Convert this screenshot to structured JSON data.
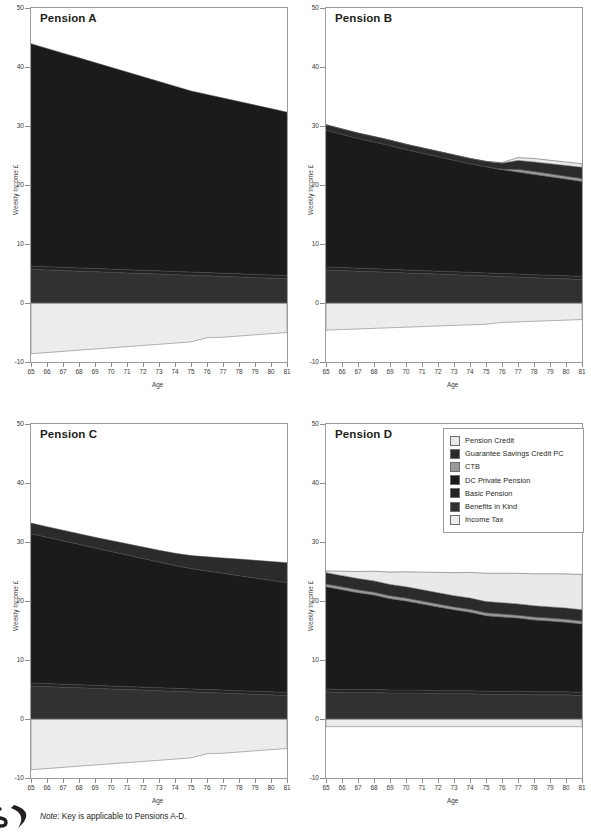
{
  "figure": {
    "note_prefix": "Note:",
    "note_text": " Key is applicable to Pensions A-D.",
    "logo_letter": "S"
  },
  "legend": {
    "title": "Key",
    "applies_to": "Pensions A-D",
    "items": [
      {
        "label": "Pension Credit",
        "color": "#e9e9e9"
      },
      {
        "label": "Guarantee Savings Credit PC",
        "color": "#2b2b2b"
      },
      {
        "label": "CTB",
        "color": "#9a9a9a"
      },
      {
        "label": "DC Private Pension",
        "color": "#1b1b1b"
      },
      {
        "label": "Basic Pension",
        "color": "#222222"
      },
      {
        "label": "Benefits in Kind",
        "color": "#313131"
      },
      {
        "label": "Income Tax",
        "color": "#ececec"
      }
    ]
  },
  "axes": {
    "ylabel": "Weekly Income £",
    "xlabel": "Age",
    "yticks": [
      "-10",
      "0",
      "10",
      "20",
      "30",
      "40",
      "50"
    ],
    "ylim": [
      -10,
      50
    ],
    "xticks": [
      "65",
      "66",
      "67",
      "68",
      "69",
      "70",
      "71",
      "72",
      "73",
      "74",
      "75",
      "76",
      "77",
      "78",
      "79",
      "80",
      "81"
    ],
    "xlim": [
      65,
      81
    ]
  },
  "chart_data": [
    {
      "type": "area",
      "title": "Pension A",
      "panel": "A",
      "xlabel": "Age",
      "ylabel": "Weekly Income £",
      "ylim": [
        -10,
        50
      ],
      "xlim": [
        65,
        81
      ],
      "grid": false,
      "x": [
        65,
        66,
        67,
        68,
        69,
        70,
        71,
        72,
        73,
        74,
        75,
        76,
        77,
        78,
        79,
        80,
        81
      ],
      "series": [
        {
          "name": "Benefits in Kind",
          "color": "#313131",
          "values": [
            5.7,
            5.6,
            5.5,
            5.4,
            5.3,
            5.2,
            5.1,
            5.0,
            4.9,
            4.8,
            4.7,
            4.6,
            4.5,
            4.4,
            4.3,
            4.2,
            4.1
          ]
        },
        {
          "name": "Basic Pension",
          "color": "#222222",
          "values": [
            0.55,
            0.55,
            0.55,
            0.55,
            0.55,
            0.55,
            0.55,
            0.55,
            0.55,
            0.55,
            0.55,
            0.55,
            0.55,
            0.55,
            0.55,
            0.55,
            0.55
          ]
        },
        {
          "name": "DC Private Pension",
          "color": "#1b1b1b",
          "values": [
            37.7,
            37.0,
            36.3,
            35.6,
            34.9,
            34.2,
            33.5,
            32.8,
            32.1,
            31.4,
            30.7,
            30.2,
            29.7,
            29.2,
            28.7,
            28.2,
            27.7
          ]
        },
        {
          "name": "CTB",
          "color": "#9a9a9a",
          "values": [
            0,
            0,
            0,
            0,
            0,
            0,
            0,
            0,
            0,
            0,
            0,
            0,
            0,
            0,
            0,
            0,
            0
          ]
        },
        {
          "name": "Guarantee Savings Credit PC",
          "color": "#2b2b2b",
          "values": [
            0,
            0,
            0,
            0,
            0,
            0,
            0,
            0,
            0,
            0,
            0,
            0,
            0,
            0,
            0,
            0,
            0
          ]
        },
        {
          "name": "Pension Credit",
          "color": "#e9e9e9",
          "values": [
            0,
            0,
            0,
            0,
            0,
            0,
            0,
            0,
            0,
            0,
            0,
            0,
            0,
            0,
            0,
            0,
            0
          ]
        },
        {
          "name": "Income Tax",
          "color": "#ececec",
          "values": [
            -8.6,
            -8.4,
            -8.2,
            -8.0,
            -7.8,
            -7.6,
            -7.4,
            -7.2,
            -7.0,
            -6.8,
            -6.6,
            -5.9,
            -5.8,
            -5.6,
            -5.4,
            -5.2,
            -5.0
          ]
        }
      ],
      "top_total_start": 44.0,
      "top_total_end": 32.4
    },
    {
      "type": "area",
      "title": "Pension B",
      "panel": "B",
      "xlabel": "Age",
      "ylabel": "Weekly Income £",
      "ylim": [
        -10,
        50
      ],
      "xlim": [
        65,
        81
      ],
      "grid": false,
      "x": [
        65,
        66,
        67,
        68,
        69,
        70,
        71,
        72,
        73,
        74,
        75,
        76,
        77,
        78,
        79,
        80,
        81
      ],
      "series": [
        {
          "name": "Benefits in Kind",
          "color": "#313131",
          "values": [
            5.6,
            5.5,
            5.4,
            5.3,
            5.2,
            5.1,
            5.0,
            4.9,
            4.8,
            4.7,
            4.6,
            4.5,
            4.4,
            4.3,
            4.2,
            4.1,
            4.0
          ]
        },
        {
          "name": "Basic Pension",
          "color": "#222222",
          "values": [
            0.5,
            0.5,
            0.5,
            0.5,
            0.5,
            0.5,
            0.5,
            0.5,
            0.5,
            0.5,
            0.5,
            0.5,
            0.5,
            0.5,
            0.5,
            0.5,
            0.5
          ]
        },
        {
          "name": "DC Private Pension",
          "color": "#1b1b1b",
          "values": [
            23.2,
            22.6,
            22.0,
            21.5,
            21.0,
            20.4,
            19.9,
            19.4,
            18.9,
            18.4,
            18.0,
            17.6,
            17.3,
            17.0,
            16.7,
            16.4,
            16.1
          ]
        },
        {
          "name": "CTB",
          "color": "#9a9a9a",
          "values": [
            0,
            0,
            0,
            0,
            0,
            0,
            0,
            0,
            0,
            0,
            0,
            0.1,
            0.45,
            0.5,
            0.5,
            0.5,
            0.5
          ]
        },
        {
          "name": "Guarantee Savings Credit PC",
          "color": "#2b2b2b",
          "values": [
            0.9,
            0.9,
            0.9,
            0.9,
            0.9,
            0.9,
            0.9,
            0.9,
            0.9,
            0.9,
            0.9,
            1.0,
            1.5,
            1.6,
            1.7,
            1.8,
            1.9
          ]
        },
        {
          "name": "Pension Credit",
          "color": "#e9e9e9",
          "values": [
            0,
            0,
            0,
            0,
            0,
            0,
            0,
            0,
            0,
            0,
            0,
            0.1,
            0.5,
            0.6,
            0.6,
            0.6,
            0.6
          ]
        },
        {
          "name": "Income Tax",
          "color": "#ececec",
          "values": [
            -4.6,
            -4.5,
            -4.4,
            -4.3,
            -4.2,
            -4.1,
            -4.0,
            -3.9,
            -3.8,
            -3.7,
            -3.6,
            -3.3,
            -3.2,
            -3.1,
            -3.0,
            -2.9,
            -2.8
          ]
        }
      ],
      "top_total_start": 30.2,
      "top_total_end": 23.6
    },
    {
      "type": "area",
      "title": "Pension C",
      "panel": "C",
      "xlabel": "Age",
      "ylabel": "Weekly Income £",
      "ylim": [
        -10,
        50
      ],
      "xlim": [
        65,
        81
      ],
      "grid": false,
      "x": [
        65,
        66,
        67,
        68,
        69,
        70,
        71,
        72,
        73,
        74,
        75,
        76,
        77,
        78,
        79,
        80,
        81
      ],
      "series": [
        {
          "name": "Benefits in Kind",
          "color": "#313131",
          "values": [
            5.6,
            5.5,
            5.4,
            5.3,
            5.2,
            5.1,
            5.0,
            4.9,
            4.8,
            4.7,
            4.6,
            4.5,
            4.4,
            4.3,
            4.2,
            4.1,
            4.0
          ]
        },
        {
          "name": "Basic Pension",
          "color": "#222222",
          "values": [
            0.5,
            0.5,
            0.5,
            0.5,
            0.5,
            0.5,
            0.5,
            0.5,
            0.5,
            0.5,
            0.5,
            0.5,
            0.5,
            0.5,
            0.5,
            0.5,
            0.5
          ]
        },
        {
          "name": "DC Private Pension",
          "color": "#1b1b1b",
          "values": [
            25.3,
            24.8,
            24.3,
            23.8,
            23.3,
            22.8,
            22.3,
            21.8,
            21.3,
            20.8,
            20.4,
            20.1,
            19.8,
            19.5,
            19.2,
            18.9,
            18.6
          ]
        },
        {
          "name": "CTB",
          "color": "#9a9a9a",
          "values": [
            0,
            0,
            0,
            0,
            0,
            0,
            0,
            0,
            0,
            0,
            0,
            0,
            0,
            0,
            0,
            0,
            0
          ]
        },
        {
          "name": "Guarantee Savings Credit PC",
          "color": "#2b2b2b",
          "values": [
            1.8,
            1.8,
            1.8,
            1.8,
            1.8,
            1.85,
            1.9,
            1.95,
            2.0,
            2.1,
            2.2,
            2.4,
            2.6,
            2.8,
            3.0,
            3.2,
            3.4
          ]
        },
        {
          "name": "Pension Credit",
          "color": "#e9e9e9",
          "values": [
            0,
            0,
            0,
            0,
            0,
            0,
            0,
            0,
            0,
            0,
            0,
            0,
            0,
            0,
            0,
            0,
            0
          ]
        },
        {
          "name": "Income Tax",
          "color": "#ececec",
          "values": [
            -8.6,
            -8.4,
            -8.2,
            -8.0,
            -7.8,
            -7.6,
            -7.4,
            -7.2,
            -7.0,
            -6.8,
            -6.6,
            -5.9,
            -5.8,
            -5.6,
            -5.4,
            -5.2,
            -5.0
          ]
        }
      ],
      "top_total_start": 33.2,
      "top_total_end": 26.5
    },
    {
      "type": "area",
      "title": "Pension D",
      "panel": "D",
      "xlabel": "Age",
      "ylabel": "Weekly Income £",
      "ylim": [
        -10,
        50
      ],
      "xlim": [
        65,
        81
      ],
      "grid": false,
      "x": [
        65,
        66,
        67,
        68,
        69,
        70,
        71,
        72,
        73,
        74,
        75,
        76,
        77,
        78,
        79,
        80,
        81
      ],
      "series": [
        {
          "name": "Benefits in Kind",
          "color": "#313131",
          "values": [
            4.6,
            4.5,
            4.5,
            4.5,
            4.4,
            4.4,
            4.4,
            4.3,
            4.3,
            4.3,
            4.2,
            4.2,
            4.2,
            4.1,
            4.1,
            4.1,
            4.0
          ]
        },
        {
          "name": "Basic Pension",
          "color": "#222222",
          "values": [
            0.5,
            0.5,
            0.5,
            0.5,
            0.5,
            0.5,
            0.5,
            0.5,
            0.5,
            0.5,
            0.5,
            0.5,
            0.5,
            0.5,
            0.5,
            0.5,
            0.5
          ]
        },
        {
          "name": "DC Private Pension",
          "color": "#1b1b1b",
          "values": [
            17.3,
            16.9,
            16.4,
            16.0,
            15.5,
            15.1,
            14.6,
            14.2,
            13.7,
            13.3,
            12.8,
            12.6,
            12.4,
            12.2,
            12.0,
            11.8,
            11.6
          ]
        },
        {
          "name": "CTB",
          "color": "#9a9a9a",
          "values": [
            0.5,
            0.5,
            0.5,
            0.5,
            0.5,
            0.5,
            0.5,
            0.5,
            0.5,
            0.5,
            0.5,
            0.5,
            0.5,
            0.5,
            0.5,
            0.5,
            0.5
          ]
        },
        {
          "name": "Guarantee Savings Credit PC",
          "color": "#2b2b2b",
          "values": [
            1.9,
            1.9,
            1.9,
            1.9,
            1.9,
            1.9,
            1.9,
            1.9,
            1.9,
            1.9,
            1.9,
            1.9,
            1.9,
            1.9,
            1.9,
            1.9,
            1.9
          ]
        },
        {
          "name": "Pension Credit",
          "color": "#e9e9e9",
          "values": [
            0.3,
            0.75,
            1.2,
            1.65,
            2.1,
            2.55,
            3.0,
            3.45,
            3.9,
            4.35,
            4.8,
            5.0,
            5.2,
            5.4,
            5.6,
            5.8,
            6.0
          ]
        },
        {
          "name": "Income Tax",
          "color": "#ececec",
          "values": [
            -1.3,
            -1.3,
            -1.3,
            -1.3,
            -1.3,
            -1.3,
            -1.3,
            -1.3,
            -1.3,
            -1.3,
            -1.3,
            -1.3,
            -1.3,
            -1.3,
            -1.3,
            -1.3,
            -1.3
          ]
        }
      ],
      "top_total_start": 25.1,
      "top_total_end": 24.5
    }
  ]
}
